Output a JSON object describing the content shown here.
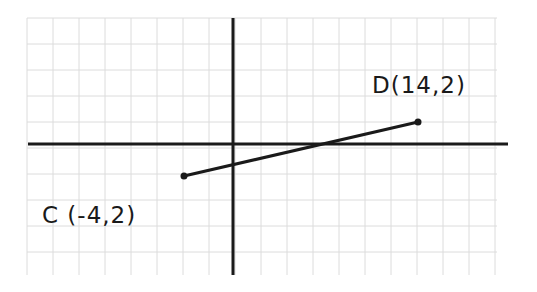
{
  "diagram": {
    "type": "coordinate-plane-segment",
    "grid": {
      "x_start": 27,
      "x_end": 497,
      "y_start": 18,
      "y_end": 275,
      "spacing": 26,
      "color": "#dcdcdc"
    },
    "axes": {
      "x_axis": {
        "y": 144,
        "x1": 28,
        "x2": 508,
        "color": "#1a1a1a"
      },
      "y_axis": {
        "x": 233,
        "y1": 18,
        "y2": 275,
        "color": "#1a1a1a"
      }
    },
    "segment": {
      "from": "C",
      "to": "D",
      "color": "#1a1a1a"
    },
    "points": [
      {
        "name": "C",
        "label": "C (-4,2)",
        "px": 184,
        "py": 176,
        "label_x": 42,
        "label_y": 223
      },
      {
        "name": "D",
        "label": "D(14,2)",
        "px": 418,
        "py": 122,
        "label_x": 372,
        "label_y": 93
      }
    ]
  }
}
